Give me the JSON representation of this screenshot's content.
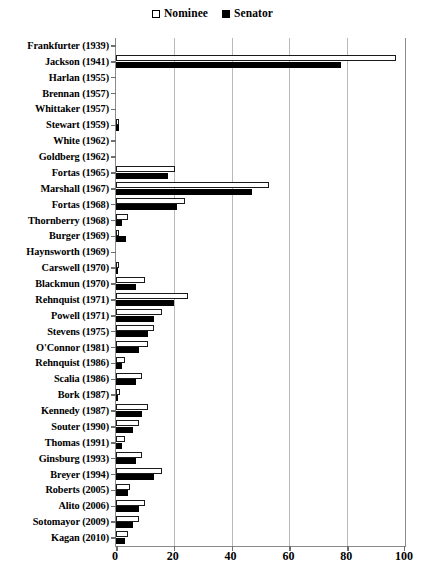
{
  "chart_data": {
    "type": "bar",
    "orientation": "horizontal",
    "title": "",
    "subtitle": "",
    "xlabel": "",
    "ylabel": "",
    "xlim": [
      0,
      100
    ],
    "xticks": [
      0,
      20,
      40,
      60,
      80,
      100
    ],
    "grid": "vertical",
    "legend_position": "top-center",
    "legend": [
      {
        "name": "Nominee",
        "swatch": "hollow-square",
        "color": "#ffffff",
        "edge": "#000000"
      },
      {
        "name": "Senator",
        "swatch": "filled-square",
        "color": "#000000",
        "edge": "#000000"
      }
    ],
    "categories": [
      "Frankfurter (1939)",
      "Jackson (1941)",
      "Harlan (1955)",
      "Brennan (1957)",
      "Whittaker (1957)",
      "Stewart (1959)",
      "White (1962)",
      "Goldberg (1962)",
      "Fortas (1965)",
      "Marshall (1967)",
      "Fortas (1968)",
      "Thornberry (1968)",
      "Burger (1969)",
      "Haynsworth (1969)",
      "Carswell (1970)",
      "Blackmun (1970)",
      "Rehnquist (1971)",
      "Powell (1971)",
      "Stevens (1975)",
      "O'Connor (1981)",
      "Rehnquist (1986)",
      "Scalia (1986)",
      "Bork (1987)",
      "Kennedy (1987)",
      "Souter (1990)",
      "Thomas (1991)",
      "Ginsburg (1993)",
      "Breyer (1994)",
      "Roberts (2005)",
      "Alito (2006)",
      "Sotomayor (2009)",
      "Kagan (2010)"
    ],
    "series": [
      {
        "name": "Nominee",
        "values": [
          0,
          97,
          0,
          0,
          0,
          1,
          0,
          0,
          20.5,
          53,
          24,
          4,
          1,
          0,
          1,
          10,
          25,
          16,
          13,
          11,
          3,
          9,
          1.5,
          11,
          8,
          3,
          9,
          16,
          5,
          10,
          8,
          4
        ]
      },
      {
        "name": "Senator",
        "values": [
          0,
          78,
          0,
          0,
          0,
          1,
          0,
          0,
          18,
          47,
          21,
          2,
          3.5,
          0,
          0.5,
          7,
          20,
          13,
          11,
          8,
          2,
          7,
          0.5,
          9,
          6,
          2,
          7,
          13,
          4,
          8,
          6,
          3
        ]
      }
    ]
  },
  "axes": {
    "x_tick_labels": [
      "0",
      "20",
      "40",
      "60",
      "80",
      "100"
    ]
  }
}
